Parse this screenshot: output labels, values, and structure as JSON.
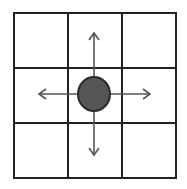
{
  "diagram": {
    "type": "grid-neighborhood",
    "grid": {
      "rows": 3,
      "cols": 3,
      "x_lines": [
        14,
        68,
        122,
        176
      ],
      "y_lines": [
        13,
        68,
        123,
        178
      ],
      "line_color": "#222222",
      "line_width": 2
    },
    "agent": {
      "cx": 94,
      "cy": 94,
      "rx": 16,
      "ry": 17,
      "fill": "#555555",
      "stroke": "#2a2a2a"
    },
    "arrows": [
      {
        "direction": "up",
        "x1": 94,
        "y1": 78,
        "x2": 94,
        "y2": 33
      },
      {
        "direction": "down",
        "x1": 94,
        "y1": 111,
        "x2": 94,
        "y2": 155
      },
      {
        "direction": "left",
        "x1": 78,
        "y1": 94,
        "x2": 39,
        "y2": 94
      },
      {
        "direction": "right",
        "x1": 110,
        "y1": 94,
        "x2": 150,
        "y2": 94
      }
    ],
    "arrow_color": "#555555"
  }
}
